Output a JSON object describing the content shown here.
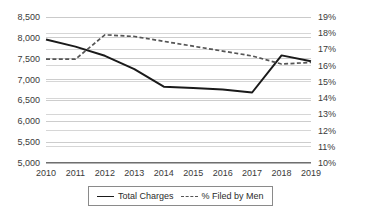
{
  "chart_data": {
    "type": "line",
    "title": "",
    "xlabel": "",
    "grid": true,
    "legend_position": "bottom",
    "categories": [
      "2010",
      "2011",
      "2012",
      "2013",
      "2014",
      "2015",
      "2016",
      "2017",
      "2018",
      "2019"
    ],
    "axes": {
      "left": {
        "label": "Total Charges",
        "ticks": [
          "5,000",
          "5,500",
          "6,000",
          "6,500",
          "7,000",
          "7,500",
          "8,000",
          "8,500"
        ],
        "tick_values": [
          5000,
          5500,
          6000,
          6500,
          7000,
          7500,
          8000,
          8500
        ],
        "ylim": [
          5000,
          8500
        ]
      },
      "right": {
        "label": "% Filed by Men",
        "ticks": [
          "10%",
          "11%",
          "12%",
          "13%",
          "14%",
          "15%",
          "16%",
          "17%",
          "18%",
          "19%"
        ],
        "tick_values": [
          10,
          11,
          12,
          13,
          14,
          15,
          16,
          17,
          18,
          19
        ],
        "ylim": [
          10,
          19
        ]
      }
    },
    "series": [
      {
        "name": "Total Charges",
        "axis": "left",
        "style": "solid",
        "color": "#1a1a1a",
        "values": [
          7960,
          7790,
          7570,
          7250,
          6830,
          6800,
          6760,
          6690,
          7580,
          7440
        ]
      },
      {
        "name": "% Filed by Men",
        "axis": "right",
        "style": "dashed",
        "color": "#555555",
        "values": [
          16.4,
          16.4,
          17.9,
          17.8,
          17.5,
          17.2,
          16.9,
          16.6,
          16.1,
          16.2
        ]
      }
    ]
  },
  "legend": {
    "items": [
      {
        "label": "Total Charges",
        "style": "solid"
      },
      {
        "label": "% Filed by Men",
        "style": "dashed"
      }
    ]
  },
  "colors": {
    "grid": "#c8c8c8",
    "axis_text": "#3a3a3a",
    "series_solid": "#1a1a1a",
    "series_dashed": "#555555",
    "legend_border": "#8a8a8a",
    "background": "#ffffff"
  }
}
